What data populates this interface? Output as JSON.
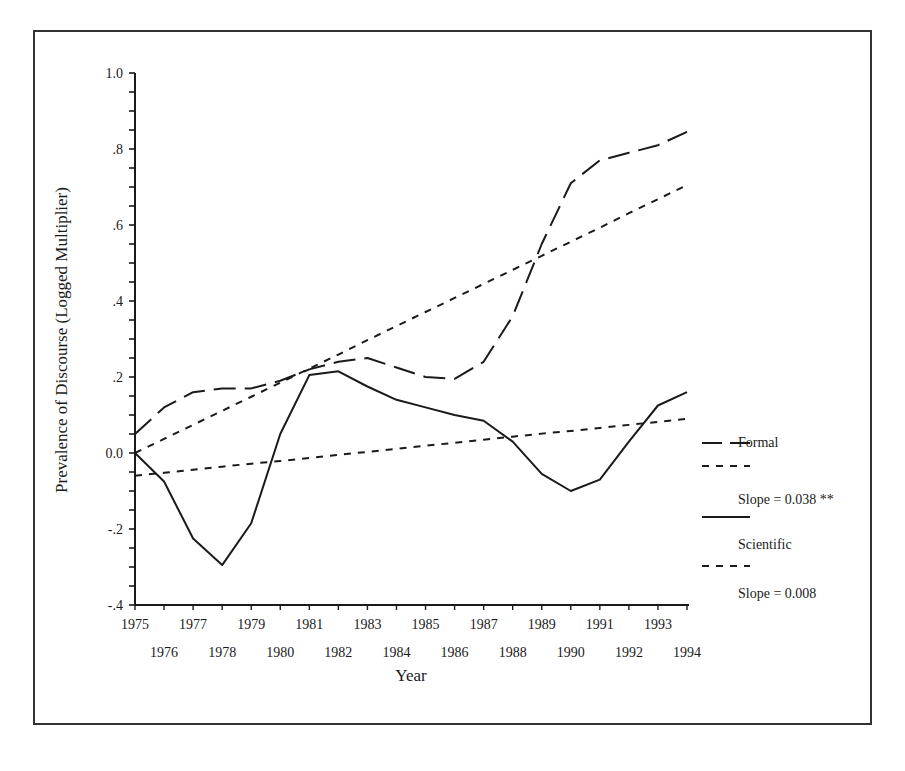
{
  "chart_data": {
    "type": "line",
    "title": "",
    "xlabel": "Year",
    "ylabel": "Prevalence of Discourse (Logged Multiplier)",
    "ylim": [
      -0.4,
      1.0
    ],
    "xlim": [
      1975,
      1994
    ],
    "grid": false,
    "legend_position": "right",
    "y_ticks": [
      "-.4",
      "-.2",
      "0.0",
      ".2",
      ".4",
      ".6",
      ".8",
      "1.0"
    ],
    "x_ticks_top_row": [
      "1975",
      "1977",
      "1979",
      "1981",
      "1983",
      "1985",
      "1987",
      "1989",
      "1991",
      "1993"
    ],
    "x_ticks_bottom_row": [
      "1976",
      "1978",
      "1980",
      "1982",
      "1984",
      "1986",
      "1988",
      "1990",
      "1992",
      "1994"
    ],
    "x": [
      1975,
      1976,
      1977,
      1978,
      1979,
      1980,
      1981,
      1982,
      1983,
      1984,
      1985,
      1986,
      1987,
      1988,
      1989,
      1990,
      1991,
      1992,
      1993,
      1994
    ],
    "series": [
      {
        "name": "Formal",
        "style": "long-dash",
        "values": [
          0.05,
          0.12,
          0.16,
          0.17,
          0.17,
          0.19,
          0.22,
          0.24,
          0.25,
          0.225,
          0.2,
          0.195,
          0.24,
          0.36,
          0.55,
          0.71,
          0.77,
          0.79,
          0.81,
          0.845
        ]
      },
      {
        "name": "Formal trend (Slope = 0.038 **)",
        "style": "short-dash",
        "values": [
          0.0,
          0.037,
          0.074,
          0.111,
          0.148,
          0.185,
          0.222,
          0.259,
          0.297,
          0.334,
          0.371,
          0.408,
          0.445,
          0.482,
          0.519,
          0.556,
          0.593,
          0.631,
          0.668,
          0.705
        ]
      },
      {
        "name": "Scientific",
        "style": "solid",
        "values": [
          0.0,
          -0.075,
          -0.225,
          -0.295,
          -0.185,
          0.05,
          0.205,
          0.215,
          0.175,
          0.14,
          0.12,
          0.1,
          0.085,
          0.03,
          -0.055,
          -0.1,
          -0.07,
          0.03,
          0.125,
          0.16
        ]
      },
      {
        "name": "Scientific trend (Slope = 0.008)",
        "style": "short-dash",
        "values": [
          -0.06,
          -0.052,
          -0.044,
          -0.036,
          -0.028,
          -0.021,
          -0.013,
          -0.005,
          0.003,
          0.011,
          0.019,
          0.027,
          0.035,
          0.043,
          0.051,
          0.058,
          0.066,
          0.074,
          0.082,
          0.09
        ]
      }
    ],
    "legend": [
      "Formal",
      "Slope = 0.038 **",
      "Scientific",
      "Slope = 0.008"
    ]
  }
}
